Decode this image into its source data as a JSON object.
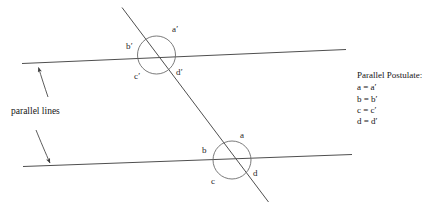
{
  "figure": {
    "stroke_color": "#4a4a4a",
    "text_color": "#141414"
  },
  "annotations": {
    "parallel_lines_label": "parallel lines"
  },
  "upper_intersection": {
    "angles": {
      "a": "a′",
      "b": "b′",
      "c": "c′",
      "d": "d′"
    }
  },
  "lower_intersection": {
    "angles": {
      "a": "a",
      "b": "b",
      "c": "c",
      "d": "d"
    }
  },
  "postulate": {
    "title": "Parallel Postulate:",
    "equations": [
      "a = a′",
      "b = b′",
      "c = c′",
      "d = d′"
    ]
  }
}
